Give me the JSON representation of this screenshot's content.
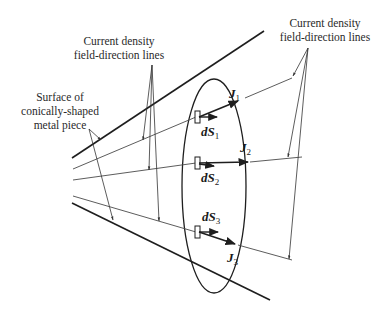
{
  "diagram": {
    "labels": {
      "surface": [
        "Surface of",
        "conically-shaped",
        "metal piece"
      ],
      "field_lines_left": [
        "Current density",
        "field-direction lines"
      ],
      "field_lines_right": [
        "Current density",
        "field-direction lines"
      ]
    },
    "vectors": {
      "J1": {
        "symbol": "J",
        "sub": "1"
      },
      "J2": {
        "symbol": "J",
        "sub": "2"
      },
      "J3": {
        "symbol": "J",
        "sub": "3"
      },
      "dS1": {
        "symbol": "dS",
        "sub": "1"
      },
      "dS2": {
        "symbol": "dS",
        "sub": "2"
      },
      "dS3": {
        "symbol": "dS",
        "sub": "3"
      }
    },
    "colors": {
      "stroke": "#1e1e1e",
      "thin": "#4a4a4a",
      "background": "#ffffff"
    }
  }
}
